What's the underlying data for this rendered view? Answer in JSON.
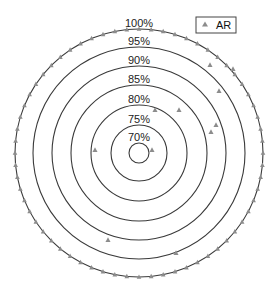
{
  "chart_data": {
    "type": "scatter",
    "subtype": "polar",
    "title": "",
    "center_px": [
      139,
      153
    ],
    "rings": [
      {
        "label": "100%",
        "value": 100,
        "radius_px": 124
      },
      {
        "label": "95%",
        "value": 95,
        "radius_px": 106
      },
      {
        "label": "90%",
        "value": 90,
        "radius_px": 87
      },
      {
        "label": "85%",
        "value": 85,
        "radius_px": 68
      },
      {
        "label": "80%",
        "value": 80,
        "radius_px": 48
      },
      {
        "label": "75%",
        "value": 75,
        "radius_px": 28
      },
      {
        "label": "70%",
        "value": 70,
        "radius_px": 10
      }
    ],
    "rlim": [
      70,
      100
    ],
    "legend": {
      "position": "upper right",
      "entries": [
        "AR"
      ]
    },
    "series": [
      {
        "name": "AR",
        "marker": "triangle",
        "color": "#8c8c8c",
        "outer_ring_point_count": 64,
        "inner_points_px": [
          [
            210,
            65
          ],
          [
            233,
            69
          ],
          [
            219,
            91
          ],
          [
            155,
            110
          ],
          [
            179,
            110
          ],
          [
            216,
            125
          ],
          [
            211,
            132
          ],
          [
            95,
            150
          ],
          [
            152,
            150
          ],
          [
            108,
            240
          ],
          [
            176,
            253
          ]
        ]
      }
    ]
  }
}
